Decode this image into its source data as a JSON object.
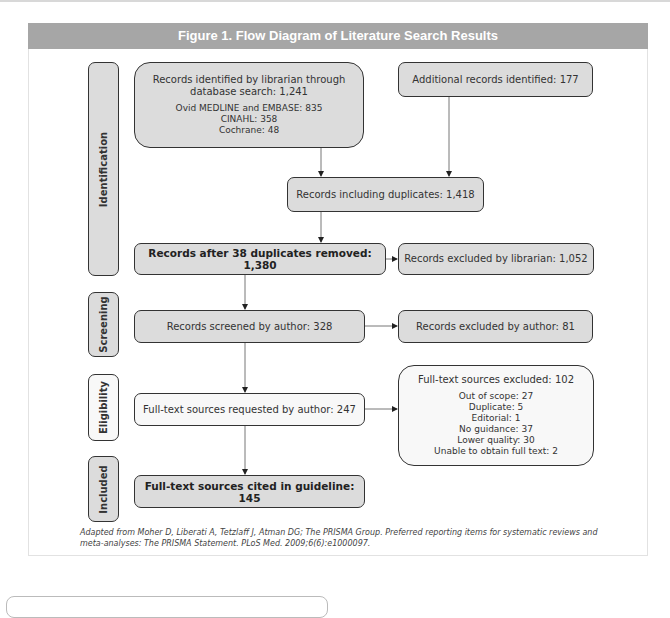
{
  "figure": {
    "title": "Figure 1. Flow Diagram of Literature Search Results",
    "header_color": "#a6a6a6"
  },
  "stages": {
    "identification": "Identification",
    "screening": "Screening",
    "eligibility": "Eligibility",
    "included": "Included"
  },
  "boxes": {
    "librarian_search": {
      "title_line1": "Records identified by librarian through",
      "title_line2": "database search: 1,241",
      "details": [
        "Ovid MEDLINE and EMBASE: 835",
        "CINAHL: 358",
        "Cochrane: 48"
      ]
    },
    "additional": "Additional records identified: 177",
    "including_duplicates": "Records including duplicates: 1,418",
    "after_duplicates": "Records after 38 duplicates removed: 1,380",
    "excluded_librarian": "Records excluded by librarian: 1,052",
    "screened_author": "Records screened by author: 328",
    "excluded_author": "Records excluded by author: 81",
    "fulltext_requested": "Full-text sources requested by author: 247",
    "fulltext_excluded": {
      "title": "Full-text sources excluded: 102",
      "details": [
        "Out of scope: 27",
        "Duplicate: 5",
        "Editorial: 1",
        "No guidance: 37",
        "Lower quality: 30",
        "Unable to obtain full text: 2"
      ]
    },
    "cited": "Full-text sources cited in guideline: 145"
  },
  "caption": {
    "line1": "Adapted from Moher D, Liberati A, Tetzlaff J, Atman DG; The PRISMA Group. Preferred reporting items for systematic reviews and",
    "line2": "meta-analyses: The PRISMA Statement. PLoS Med. 2009;6(6):e1000097."
  },
  "colors": {
    "gray_fill": "#dcdcdc",
    "white_fill": "#f8f8f8",
    "border": "#333333"
  }
}
